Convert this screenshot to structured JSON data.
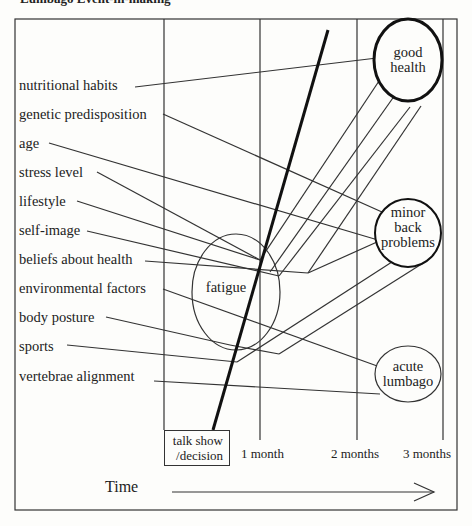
{
  "title": "Lumbago Event-in-making",
  "factors": [
    {
      "label": "nutritional habits",
      "x": 19,
      "y": 77
    },
    {
      "label": "genetic predisposition",
      "x": 19,
      "y": 106
    },
    {
      "label": "age",
      "x": 19,
      "y": 135
    },
    {
      "label": "stress level",
      "x": 19,
      "y": 164
    },
    {
      "label": "lifestyle",
      "x": 19,
      "y": 193
    },
    {
      "label": "self-image",
      "x": 19,
      "y": 222
    },
    {
      "label": "beliefs about health",
      "x": 19,
      "y": 251
    },
    {
      "label": "environmental factors",
      "x": 19,
      "y": 280
    },
    {
      "label": "body posture",
      "x": 19,
      "y": 309
    },
    {
      "label": "sports",
      "x": 19,
      "y": 338
    },
    {
      "label": "vertebrae alignment",
      "x": 19,
      "y": 368
    }
  ],
  "states": {
    "fatigue": "fatigue",
    "good_health_line1": "good",
    "good_health_line2": "health",
    "minor_line1": "minor",
    "minor_line2": "back",
    "minor_line3": "problems",
    "acute_line1": "acute",
    "acute_line2": "lumbago"
  },
  "timeline": {
    "start_line1": "talk show",
    "start_line2": "/decision",
    "ticks": [
      "1 month",
      "2 months",
      "3 months"
    ],
    "axis_label": "Time"
  }
}
